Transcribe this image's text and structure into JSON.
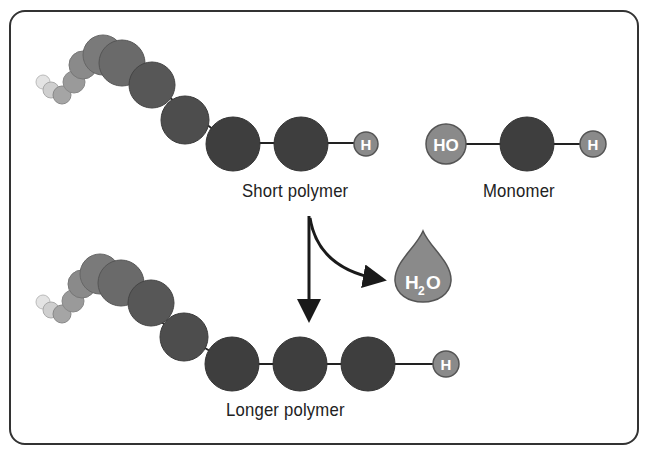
{
  "diagram": {
    "labels": {
      "short_polymer": "Short polymer",
      "monomer": "Monomer",
      "longer_polymer": "Longer polymer"
    },
    "atoms": {
      "hydrogen": "H",
      "hydroxyl": "HO",
      "water_main": "H",
      "water_sub": "2",
      "water_o": "O"
    },
    "colors": {
      "frame": "#333333",
      "monomer_dark": "#3e3e3e",
      "monomer_mid": "#555555",
      "cap_grey": "#8a8a8a",
      "fade_light": "#d4d4d4",
      "arrow": "#1a1a1a"
    }
  }
}
